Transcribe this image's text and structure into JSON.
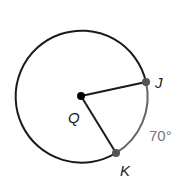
{
  "diagram": {
    "type": "circle-arc",
    "center": {
      "label": "Q",
      "x": 81,
      "y": 96
    },
    "radius": 66,
    "points": [
      {
        "label": "J",
        "x": 146,
        "y": 82
      },
      {
        "label": "K",
        "x": 116,
        "y": 153
      }
    ],
    "arc": {
      "from": "J",
      "to": "K",
      "measure": "70°"
    },
    "colors": {
      "circle": "#1a1a1a",
      "minor_arc": "#666666",
      "label_gray": "#777777"
    }
  }
}
